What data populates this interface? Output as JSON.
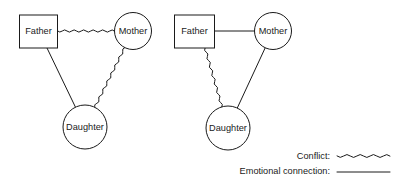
{
  "figure": {
    "type": "genogram",
    "width": 405,
    "height": 188,
    "background_color": "#ffffff",
    "line_color": "#1a1a1a"
  },
  "groups": [
    {
      "id": "left-family",
      "name": "left-genogram",
      "nodes": [
        {
          "id": "father",
          "label": "Father",
          "shape": "square",
          "cx": 38.5,
          "cy": 31.5,
          "w": 38,
          "h": 33
        },
        {
          "id": "mother",
          "label": "Mother",
          "shape": "circle",
          "cx": 133,
          "cy": 31,
          "r": 18.5
        },
        {
          "id": "daughter",
          "label": "Daughter",
          "shape": "circle",
          "cx": 85,
          "cy": 127,
          "r": 22
        }
      ],
      "links": [
        {
          "from": "father",
          "to": "mother",
          "type": "conflict",
          "style": "wavy"
        },
        {
          "from": "father",
          "to": "daughter",
          "type": "emotional-connection",
          "style": "straight"
        },
        {
          "from": "mother",
          "to": "daughter",
          "type": "conflict",
          "style": "wavy"
        }
      ]
    },
    {
      "id": "right-family",
      "name": "right-genogram",
      "nodes": [
        {
          "id": "father",
          "label": "Father",
          "shape": "square",
          "cx": 194.5,
          "cy": 31.5,
          "w": 40,
          "h": 33
        },
        {
          "id": "mother",
          "label": "Mother",
          "shape": "circle",
          "cx": 273,
          "cy": 31,
          "r": 18.5
        },
        {
          "id": "daughter",
          "label": "Daughter",
          "shape": "circle",
          "cx": 228,
          "cy": 128,
          "r": 22
        }
      ],
      "links": [
        {
          "from": "father",
          "to": "mother",
          "type": "emotional-connection",
          "style": "straight"
        },
        {
          "from": "father",
          "to": "daughter",
          "type": "conflict",
          "style": "wavy"
        },
        {
          "from": "mother",
          "to": "daughter",
          "type": "emotional-connection",
          "style": "straight"
        }
      ]
    }
  ],
  "legend": {
    "items": [
      {
        "id": "conflict",
        "label": "Conflict:",
        "style": "wavy"
      },
      {
        "id": "emotional-connection",
        "label": "Emotional connection:",
        "style": "straight"
      }
    ]
  },
  "chart_data": {
    "type": "diagram",
    "title": "",
    "nodes": [
      "Father",
      "Mother",
      "Daughter"
    ],
    "panels": [
      {
        "panel": "left",
        "edges": [
          {
            "source": "Father",
            "target": "Mother",
            "relation": "Conflict"
          },
          {
            "source": "Father",
            "target": "Daughter",
            "relation": "Emotional connection"
          },
          {
            "source": "Mother",
            "target": "Daughter",
            "relation": "Conflict"
          }
        ]
      },
      {
        "panel": "right",
        "edges": [
          {
            "source": "Father",
            "target": "Mother",
            "relation": "Emotional connection"
          },
          {
            "source": "Father",
            "target": "Daughter",
            "relation": "Conflict"
          },
          {
            "source": "Mother",
            "target": "Daughter",
            "relation": "Emotional connection"
          }
        ]
      }
    ],
    "legend": [
      "Conflict",
      "Emotional connection"
    ]
  }
}
